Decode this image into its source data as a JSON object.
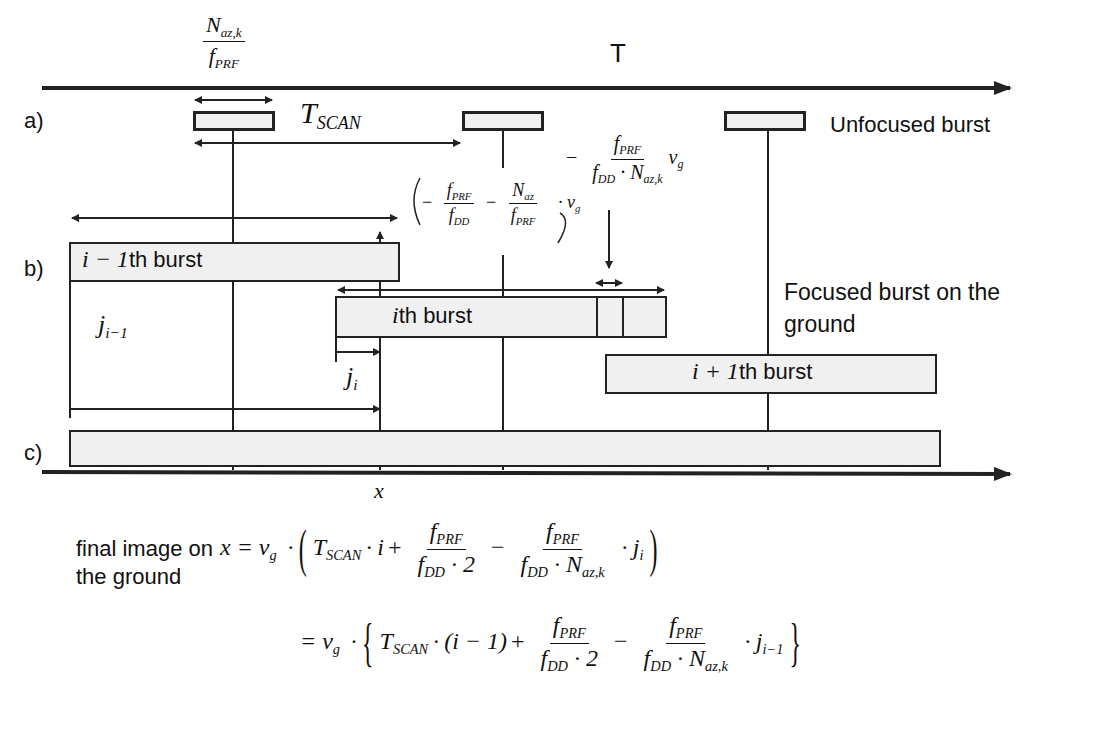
{
  "figure": {
    "axis_top_label": "T",
    "axis_bottom_label": "x",
    "panels": {
      "a": "a)",
      "b": "b)",
      "c": "c)"
    },
    "burst_length_fraction": {
      "num_sym": "N",
      "num_sub": "az,k",
      "den_sym": "f",
      "den_sub": "PRF"
    },
    "t_scan": {
      "sym": "T",
      "sub": "SCAN"
    },
    "unfocused_label": "Unfocused burst",
    "focused_label_line1": "Focused burst on the",
    "focused_label_line2": "ground",
    "bursts": {
      "prev": {
        "math": "i − 1",
        "text": "th burst"
      },
      "curr": {
        "math": "i",
        "text": "th burst"
      },
      "next": {
        "math": "i + 1",
        "text": "th burst"
      }
    },
    "j_prev": {
      "sym": "j",
      "sub": "i−1"
    },
    "j_curr": {
      "sym": "j",
      "sub": "i"
    },
    "shift_formula": {
      "minus": "−",
      "f_prf": "PRF",
      "f_dd": "DD",
      "n_az": "az",
      "v_sub": "g"
    },
    "step_formula": {
      "minus": "−",
      "num_sub": "PRF",
      "den_sub1": "DD",
      "den_sub2": "az,k",
      "v_sub": "g"
    },
    "final_caption_line1": "final image on",
    "final_caption_line2": "the ground",
    "equation_line1": {
      "lhs": "x = v",
      "lhs_sub": "g",
      "t_sub": "SCAN",
      "index": "i",
      "j": "j",
      "j_sub": "i"
    },
    "equation_line2": {
      "lhs": "= v",
      "lhs_sub": "g",
      "t_sub": "SCAN",
      "index": "(i − 1)",
      "j": "j",
      "j_sub": "i−1"
    },
    "colors": {
      "line": "#222222",
      "box_fill": "#f0f0f0",
      "text": "#111111",
      "background": "#ffffff"
    }
  }
}
